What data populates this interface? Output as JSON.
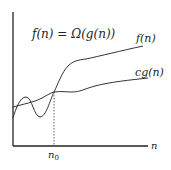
{
  "diagram": {
    "title": "f(n) = Ω(g(n))",
    "x_axis_label": "n",
    "threshold_label": "n",
    "threshold_subscript": "0",
    "curves": [
      {
        "name": "f(n)",
        "label": "f(n)"
      },
      {
        "name": "cg(n)",
        "label": "cg(n)"
      }
    ],
    "colors": {
      "axis": "#222222",
      "curve": "#333333",
      "dashed": "#555555"
    }
  }
}
